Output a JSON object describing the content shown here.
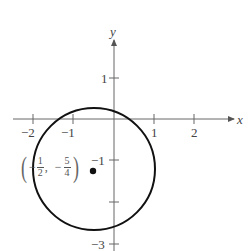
{
  "diagram": {
    "type": "circle-on-coordinate-plane",
    "axes": {
      "x_label": "x",
      "y_label": "y",
      "x_ticks": [
        "−2",
        "−1",
        "1",
        "2"
      ],
      "y_ticks": [
        "1",
        "−1",
        "−3"
      ]
    },
    "circle": {
      "center_label": {
        "x_sign": "−",
        "x_num": "1",
        "x_den": "2",
        "separator": ",",
        "y_sign": "−",
        "y_num": "5",
        "y_den": "4"
      },
      "center": [
        -0.5,
        -1.25
      ],
      "radius": 1.5
    },
    "colors": {
      "axis": "#555555",
      "circle": "#111111",
      "point": "#111111"
    }
  }
}
